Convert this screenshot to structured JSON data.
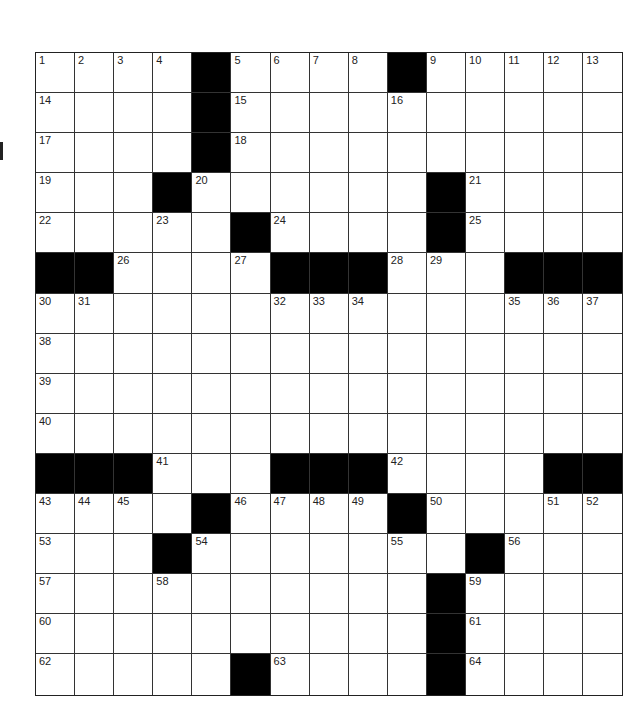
{
  "puzzle": {
    "type": "crossword",
    "rows": 16,
    "cols": 15,
    "layout": [
      "0000100001 00000",
      "000010000000000",
      "000010000000000",
      "000100000010000",
      "000001000010000",
      "110000111000111",
      "000000000000000",
      "000000000000000",
      "000000000000000",
      "000000000000000",
      "111000111000011",
      "000010000100000",
      "000100000001000",
      "000000000010000",
      "000000000010000",
      "000001000010000"
    ],
    "numbers": [
      {
        "r": 0,
        "c": 0,
        "n": "1"
      },
      {
        "r": 0,
        "c": 1,
        "n": "2"
      },
      {
        "r": 0,
        "c": 2,
        "n": "3"
      },
      {
        "r": 0,
        "c": 3,
        "n": "4"
      },
      {
        "r": 0,
        "c": 5,
        "n": "5"
      },
      {
        "r": 0,
        "c": 6,
        "n": "6"
      },
      {
        "r": 0,
        "c": 7,
        "n": "7"
      },
      {
        "r": 0,
        "c": 8,
        "n": "8"
      },
      {
        "r": 0,
        "c": 10,
        "n": "9"
      },
      {
        "r": 0,
        "c": 11,
        "n": "10"
      },
      {
        "r": 0,
        "c": 12,
        "n": "11"
      },
      {
        "r": 0,
        "c": 13,
        "n": "12"
      },
      {
        "r": 0,
        "c": 14,
        "n": "13"
      },
      {
        "r": 1,
        "c": 0,
        "n": "14"
      },
      {
        "r": 1,
        "c": 5,
        "n": "15"
      },
      {
        "r": 1,
        "c": 9,
        "n": "16"
      },
      {
        "r": 2,
        "c": 0,
        "n": "17"
      },
      {
        "r": 2,
        "c": 5,
        "n": "18"
      },
      {
        "r": 3,
        "c": 0,
        "n": "19"
      },
      {
        "r": 3,
        "c": 4,
        "n": "20"
      },
      {
        "r": 3,
        "c": 11,
        "n": "21"
      },
      {
        "r": 4,
        "c": 0,
        "n": "22"
      },
      {
        "r": 4,
        "c": 3,
        "n": "23"
      },
      {
        "r": 4,
        "c": 6,
        "n": "24"
      },
      {
        "r": 4,
        "c": 11,
        "n": "25"
      },
      {
        "r": 5,
        "c": 2,
        "n": "26"
      },
      {
        "r": 5,
        "c": 5,
        "n": "27"
      },
      {
        "r": 5,
        "c": 9,
        "n": "28"
      },
      {
        "r": 5,
        "c": 10,
        "n": "29"
      },
      {
        "r": 6,
        "c": 0,
        "n": "30"
      },
      {
        "r": 6,
        "c": 1,
        "n": "31"
      },
      {
        "r": 6,
        "c": 6,
        "n": "32"
      },
      {
        "r": 6,
        "c": 7,
        "n": "33"
      },
      {
        "r": 6,
        "c": 8,
        "n": "34"
      },
      {
        "r": 6,
        "c": 12,
        "n": "35"
      },
      {
        "r": 6,
        "c": 13,
        "n": "36"
      },
      {
        "r": 6,
        "c": 14,
        "n": "37"
      },
      {
        "r": 7,
        "c": 0,
        "n": "38"
      },
      {
        "r": 8,
        "c": 0,
        "n": "39"
      },
      {
        "r": 9,
        "c": 0,
        "n": "40"
      },
      {
        "r": 10,
        "c": 3,
        "n": "41"
      },
      {
        "r": 10,
        "c": 9,
        "n": "42"
      },
      {
        "r": 11,
        "c": 0,
        "n": "43"
      },
      {
        "r": 11,
        "c": 1,
        "n": "44"
      },
      {
        "r": 11,
        "c": 2,
        "n": "45"
      },
      {
        "r": 11,
        "c": 5,
        "n": "46"
      },
      {
        "r": 11,
        "c": 6,
        "n": "47"
      },
      {
        "r": 11,
        "c": 7,
        "n": "48"
      },
      {
        "r": 11,
        "c": 8,
        "n": "49"
      },
      {
        "r": 11,
        "c": 10,
        "n": "50"
      },
      {
        "r": 11,
        "c": 13,
        "n": "51"
      },
      {
        "r": 11,
        "c": 14,
        "n": "52"
      },
      {
        "r": 12,
        "c": 0,
        "n": "53"
      },
      {
        "r": 12,
        "c": 4,
        "n": "54"
      },
      {
        "r": 12,
        "c": 9,
        "n": "55"
      },
      {
        "r": 12,
        "c": 12,
        "n": "56"
      },
      {
        "r": 13,
        "c": 0,
        "n": "57"
      },
      {
        "r": 13,
        "c": 3,
        "n": "58"
      },
      {
        "r": 13,
        "c": 11,
        "n": "59"
      },
      {
        "r": 14,
        "c": 0,
        "n": "60"
      },
      {
        "r": 14,
        "c": 11,
        "n": "61"
      },
      {
        "r": 15,
        "c": 0,
        "n": "62"
      },
      {
        "r": 15,
        "c": 6,
        "n": "63"
      },
      {
        "r": 15,
        "c": 11,
        "n": "64"
      }
    ],
    "colors": {
      "block": "#000000",
      "cell": "#ffffff",
      "line": "#333333"
    }
  }
}
